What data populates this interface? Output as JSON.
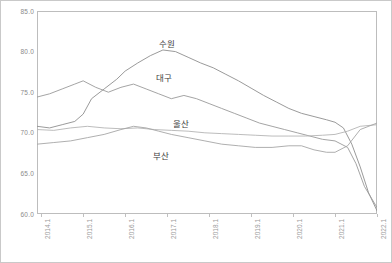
{
  "chart_data": {
    "type": "line",
    "title": "",
    "subtitle": "",
    "xlabel": "",
    "ylabel": "",
    "ylim": [
      60.0,
      85.0
    ],
    "yticks": [
      "85.0",
      "80.0",
      "75.0",
      "70.0",
      "65.0",
      "60.0"
    ],
    "ytick_values": [
      85.0,
      80.0,
      75.0,
      70.0,
      65.0,
      60.0
    ],
    "grid": false,
    "legend_position": "inline-annotation",
    "x": [
      "2014.1",
      "2015.1",
      "2016.1",
      "2017.1",
      "2018.1",
      "2019.1",
      "2020.1",
      "2021.1",
      "2022.1"
    ],
    "xticklabels": [
      "2014.1",
      "2015.1",
      "2016.1",
      "2017.1",
      "2018.1",
      "2019.1",
      "2020.1",
      "2021.1",
      "2022.1"
    ],
    "xlim": [
      2014.0,
      2022.1
    ],
    "series": [
      {
        "name": "수원",
        "color": "#8f8f8f",
        "annotation": "수원",
        "x": [
          2014.0,
          2014.3,
          2014.6,
          2014.9,
          2015.1,
          2015.3,
          2015.6,
          2015.9,
          2016.1,
          2016.4,
          2016.7,
          2017.0,
          2017.3,
          2017.6,
          2017.9,
          2018.2,
          2018.5,
          2018.8,
          2019.1,
          2019.4,
          2019.7,
          2020.0,
          2020.3,
          2020.6,
          2020.9,
          2021.1,
          2021.3,
          2021.5,
          2021.7,
          2021.9,
          2022.1
        ],
        "values": [
          70.8,
          70.6,
          71.0,
          71.4,
          72.3,
          74.2,
          75.4,
          76.6,
          77.6,
          78.6,
          79.5,
          80.2,
          80.0,
          79.3,
          78.6,
          78.0,
          77.2,
          76.4,
          75.5,
          74.6,
          73.8,
          73.0,
          72.4,
          72.0,
          71.6,
          71.3,
          70.6,
          68.6,
          65.8,
          62.6,
          60.4
        ]
      },
      {
        "name": "대구",
        "color": "#9a9a9a",
        "annotation": "대구",
        "x": [
          2014.0,
          2014.3,
          2014.6,
          2014.9,
          2015.1,
          2015.4,
          2015.7,
          2016.0,
          2016.3,
          2016.6,
          2016.9,
          2017.2,
          2017.5,
          2017.8,
          2018.1,
          2018.4,
          2018.7,
          2019.0,
          2019.3,
          2019.6,
          2019.9,
          2020.2,
          2020.5,
          2020.8,
          2021.1,
          2021.4,
          2021.6,
          2021.8,
          2022.1
        ],
        "values": [
          74.4,
          74.8,
          75.4,
          76.0,
          76.4,
          75.6,
          75.0,
          75.6,
          76.0,
          75.4,
          74.8,
          74.2,
          74.6,
          74.2,
          73.6,
          73.0,
          72.4,
          71.8,
          71.2,
          70.8,
          70.4,
          70.0,
          69.6,
          69.2,
          69.0,
          68.2,
          66.2,
          63.4,
          60.8
        ]
      },
      {
        "name": "울산",
        "color": "#b4b4b4",
        "annotation": "울산",
        "x": [
          2014.0,
          2014.4,
          2014.8,
          2015.2,
          2015.6,
          2016.0,
          2016.4,
          2016.8,
          2017.2,
          2017.6,
          2018.0,
          2018.4,
          2018.8,
          2019.2,
          2019.6,
          2020.0,
          2020.4,
          2020.8,
          2021.1,
          2021.4,
          2021.7,
          2022.1
        ],
        "values": [
          70.4,
          70.3,
          70.6,
          70.8,
          70.6,
          70.5,
          70.6,
          70.4,
          70.3,
          70.2,
          70.0,
          69.9,
          69.8,
          69.7,
          69.6,
          69.6,
          69.6,
          69.7,
          69.8,
          70.2,
          70.8,
          71.0
        ]
      },
      {
        "name": "부산",
        "color": "#a6a6a6",
        "annotation": "부산",
        "x": [
          2014.0,
          2014.4,
          2014.8,
          2015.2,
          2015.6,
          2016.0,
          2016.3,
          2016.6,
          2016.9,
          2017.2,
          2017.6,
          2018.0,
          2018.4,
          2018.8,
          2019.2,
          2019.6,
          2020.0,
          2020.3,
          2020.6,
          2020.9,
          2021.1,
          2021.4,
          2021.7,
          2022.1
        ],
        "values": [
          68.6,
          68.8,
          69.0,
          69.4,
          69.8,
          70.4,
          70.8,
          70.6,
          70.2,
          69.8,
          69.4,
          69.0,
          68.6,
          68.4,
          68.2,
          68.2,
          68.4,
          68.4,
          67.9,
          67.6,
          67.6,
          68.4,
          70.4,
          71.2
        ]
      }
    ]
  },
  "annotations": {
    "suwon": "수원",
    "daegu": "대구",
    "ulsan": "울산",
    "busan": "부산"
  }
}
